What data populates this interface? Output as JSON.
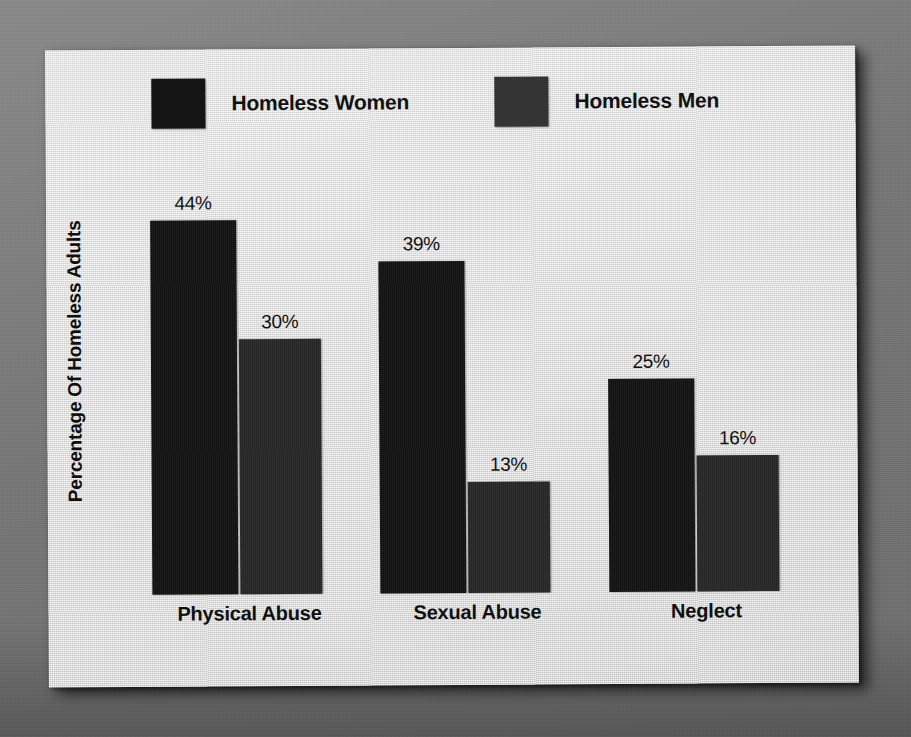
{
  "chart_data": {
    "type": "bar",
    "title": "",
    "xlabel": "",
    "ylabel": "Percentage Of Homeless Adults",
    "ylim": [
      0,
      50
    ],
    "grid": false,
    "legend_position": "top",
    "value_suffix": "%",
    "categories": [
      "Physical Abuse",
      "Sexual Abuse",
      "Neglect"
    ],
    "series": [
      {
        "name": "Homeless Women",
        "color": "#141414",
        "values": [
          44,
          39,
          25
        ],
        "labels": [
          "44%",
          "39%",
          "25%"
        ]
      },
      {
        "name": "Homeless Men",
        "color": "#282828",
        "values": [
          30,
          13,
          16
        ],
        "labels": [
          "30%",
          "13%",
          "16%"
        ]
      }
    ]
  },
  "legend": {
    "items": [
      {
        "label": "Homeless Women",
        "swatch_color": "#141414",
        "swatch_name": "legend-swatch-homeless-women"
      },
      {
        "label": "Homeless Men",
        "swatch_color": "#343434",
        "swatch_name": "legend-swatch-homeless-men"
      }
    ]
  },
  "axis": {
    "y_title": "Percentage Of Homeless Adults"
  },
  "colors": {
    "backdrop": "#7b7b7b",
    "panel": "#d8d8d8",
    "series_women": "#141414",
    "series_men": "#282828",
    "text": "#111111"
  }
}
